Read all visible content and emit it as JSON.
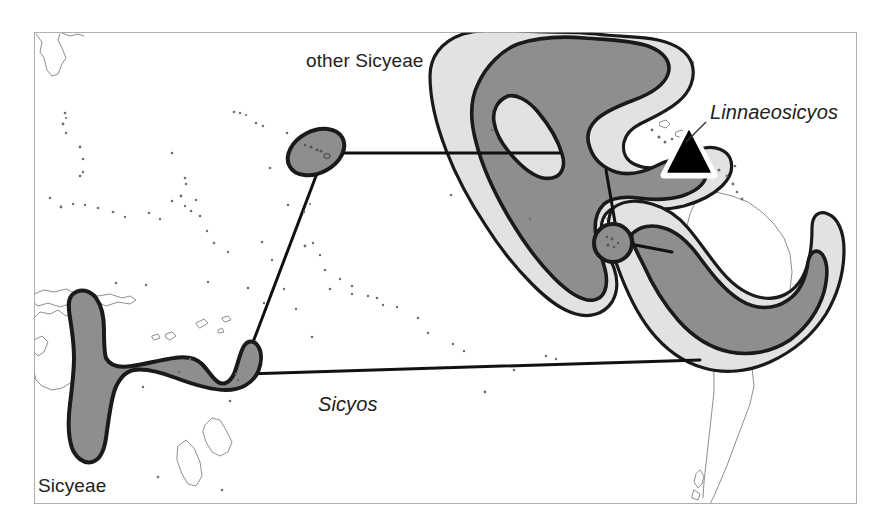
{
  "figure": {
    "kind": "biogeographic-distribution-map",
    "background_color": "#ffffff",
    "frame": {
      "x": 33,
      "y": 31,
      "width": 825,
      "height": 474,
      "stroke_color": "#999999"
    }
  },
  "labels": {
    "other_sicyeae": "other Sicyeae",
    "linnaeosicyos": "Linnaeosicyos",
    "sicyos": "Sicyos",
    "sicyeae": "Sicyeae"
  },
  "legend_styles": {
    "light_gray_range": "#e2e2e2",
    "dark_gray_range": "#8e8e8e",
    "range_outline": "#1a1a1a",
    "coastline": "#8c8c8c",
    "connector_line": "#111111",
    "marker_fill": "#000000",
    "marker_halo": "#ffffff"
  },
  "markers": [
    {
      "name": "linnaeosicyos-triangle",
      "shape": "triangle",
      "x": 689,
      "y": 153,
      "size": 46,
      "fill": "#000000",
      "halo": "#ffffff"
    }
  ],
  "distribution_areas": [
    {
      "name": "hawaii-ellipse",
      "taxon": "other Sicyeae",
      "shade": "dark"
    },
    {
      "name": "galapagos-circle",
      "taxon": "other Sicyeae",
      "shade": "dark"
    },
    {
      "name": "australasia-blob",
      "taxon": "Sicyos",
      "shade": "dark"
    },
    {
      "name": "north-central-america-outer",
      "taxon": "Sicyeae",
      "shade": "light"
    },
    {
      "name": "north-central-america-inner",
      "taxon": "other Sicyeae",
      "shade": "dark"
    },
    {
      "name": "south-america-outer",
      "taxon": "Sicyeae",
      "shade": "light"
    },
    {
      "name": "south-america-inner",
      "taxon": "Sicyos",
      "shade": "dark"
    }
  ],
  "connectors": [
    {
      "name": "hawaii-to-americas",
      "from": "hawaii-ellipse",
      "to": "north-central-america-inner"
    },
    {
      "name": "hawaii-to-australasia",
      "from": "hawaii-ellipse",
      "to": "australasia-blob"
    },
    {
      "name": "australasia-to-south-america",
      "from": "australasia-blob",
      "to": "south-america-inner"
    },
    {
      "name": "galapagos-to-americas",
      "from": "galapagos-circle",
      "to": "north-central-america-inner"
    },
    {
      "name": "galapagos-to-south-america",
      "from": "galapagos-circle",
      "to": "south-america-inner"
    }
  ]
}
